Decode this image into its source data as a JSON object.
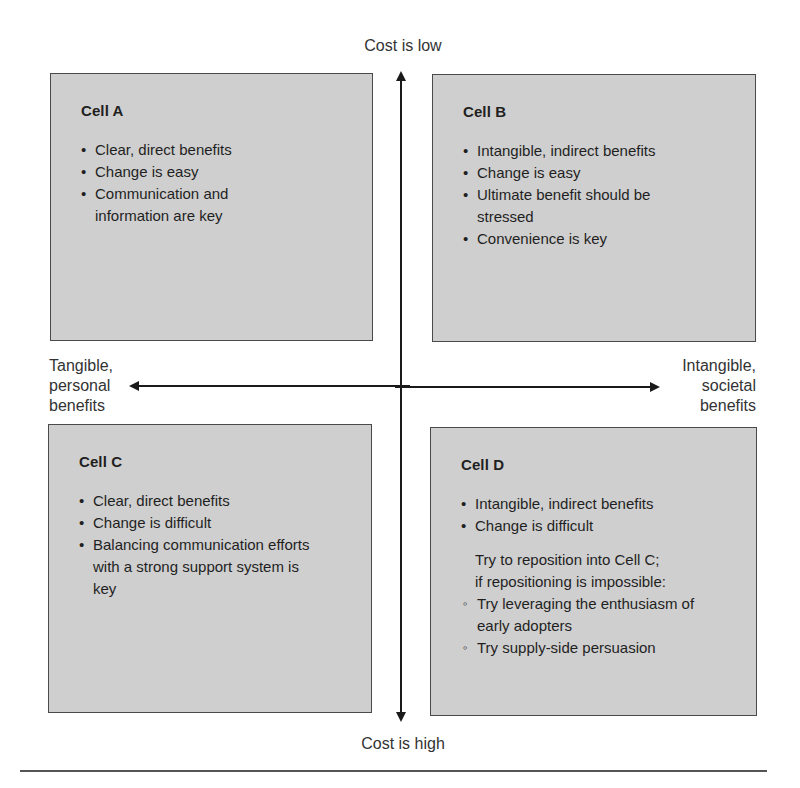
{
  "axes": {
    "vertical": {
      "top_label": "Cost is low",
      "bottom_label": "Cost is high"
    },
    "horizontal": {
      "left_label": "Tangible, personal benefits",
      "left_label_lines": [
        "Tangible,",
        "personal",
        "benefits"
      ],
      "right_label": "Intangible, societal benefits",
      "right_label_lines": [
        "Intangible,",
        "societal",
        "benefits"
      ]
    }
  },
  "cells": {
    "a": {
      "title": "Cell A",
      "bullets": [
        "Clear, direct benefits",
        "Change is easy",
        "Communication and information are key"
      ]
    },
    "b": {
      "title": "Cell B",
      "bullets": [
        "Intangible, indirect benefits",
        "Change is easy",
        "Ultimate benefit should be stressed",
        "Convenience is key"
      ]
    },
    "c": {
      "title": "Cell C",
      "bullets": [
        "Clear, direct benefits",
        "Change is difficult",
        "Balancing communication efforts with a strong support system is key"
      ]
    },
    "d": {
      "title": "Cell D",
      "bullets": [
        "Intangible, indirect benefits",
        "Change is difficult"
      ],
      "note_lines": [
        "Try to reposition into Cell C;",
        "if repositioning is impossible:"
      ],
      "sub_bullets": [
        "Try leveraging the enthusiasm of early adopters",
        "Try supply-side persuasion"
      ]
    }
  },
  "colors": {
    "cell_fill": "#cfcfcf",
    "cell_border": "#4a4a4a",
    "axis": "#1a1a1a",
    "text": "#1f1f1f"
  }
}
